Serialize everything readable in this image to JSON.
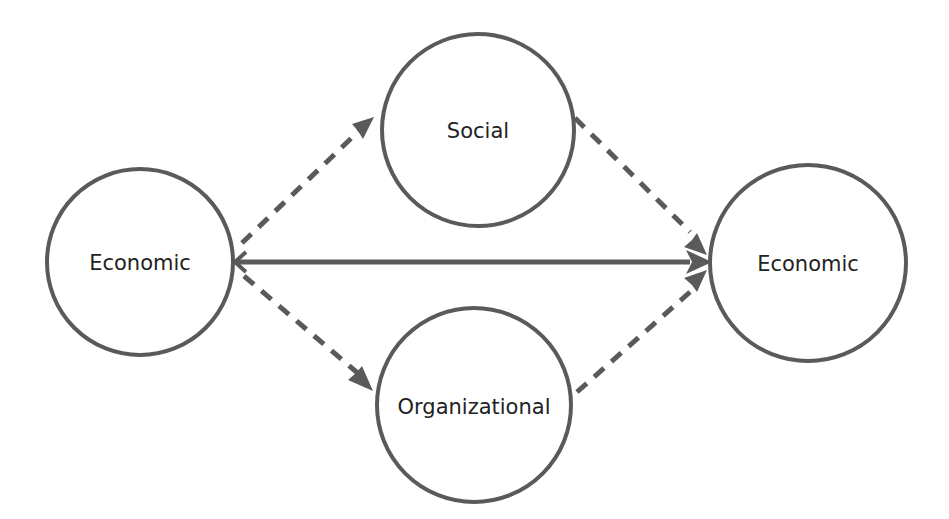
{
  "diagram": {
    "type": "flow",
    "colors": {
      "stroke": "#5a5a5a",
      "text": "#222222",
      "background": "#ffffff"
    },
    "nodes": [
      {
        "id": "economic_left",
        "label": "Economic",
        "cx": 140,
        "cy": 262,
        "r": 93
      },
      {
        "id": "social",
        "label": "Social",
        "cx": 478,
        "cy": 130,
        "r": 96
      },
      {
        "id": "organizational",
        "label": "Organizational",
        "cx": 474,
        "cy": 405,
        "r": 97
      },
      {
        "id": "economic_right",
        "label": "Economic",
        "cx": 808,
        "cy": 263,
        "r": 98
      }
    ],
    "edges": [
      {
        "from": "economic_left",
        "to": "economic_right",
        "style": "solid"
      },
      {
        "from": "economic_left",
        "to": "social",
        "style": "dashed"
      },
      {
        "from": "economic_left",
        "to": "organizational",
        "style": "dashed"
      },
      {
        "from": "social",
        "to": "economic_right",
        "style": "dashed"
      },
      {
        "from": "organizational",
        "to": "economic_right",
        "style": "dashed"
      }
    ]
  }
}
